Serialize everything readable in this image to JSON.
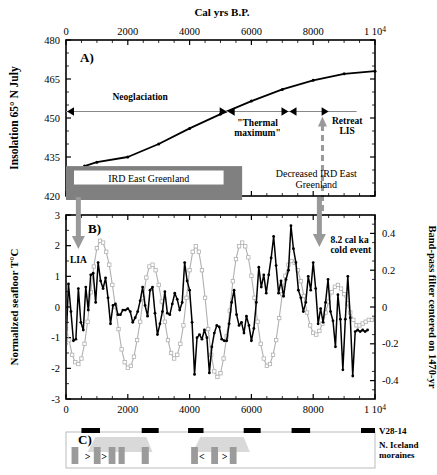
{
  "figure": {
    "top_axis_title": "Cal yrs B.P.",
    "x_ticks": [
      "0",
      "2000",
      "4000",
      "6000",
      "8000",
      "1 10"
    ],
    "x_exponent": "4",
    "x_values": [
      0,
      2000,
      4000,
      6000,
      8000,
      10000
    ],
    "x_range": [
      0,
      10000
    ]
  },
  "panelA": {
    "label": "A)",
    "ylabel": "Insolation 65° N July",
    "y_ticks": [
      "420",
      "435",
      "450",
      "465",
      "480"
    ],
    "y_values": [
      420,
      435,
      450,
      465,
      480
    ],
    "y_range": [
      420,
      480
    ],
    "annotations": {
      "neoglaciation": "Neoglaciation",
      "thermal_max_line1": "\"Thermal",
      "thermal_max_line2": "maximum\"",
      "retreat_line1": "Retreat",
      "retreat_line2": "LIS",
      "ird_bar_label": "IRD East Greenland",
      "decreased_line1": "Decreased IRD East",
      "decreased_line2": "Greenland"
    },
    "arrow_spans": {
      "neoglaciation": [
        0,
        5200
      ],
      "thermal_maximum": [
        5200,
        7200
      ],
      "retreat_lis": [
        7200,
        8500
      ]
    },
    "chart_data": {
      "type": "line",
      "title": "Insolation 65° N July",
      "xlabel": "Cal yrs B.P.",
      "ylabel": "Insolation 65° N July",
      "xlim": [
        0,
        10000
      ],
      "ylim": [
        420,
        480
      ],
      "grid": false,
      "x": [
        600,
        1000,
        2000,
        3000,
        4000,
        5000,
        6000,
        7000,
        8000,
        9000,
        10000
      ],
      "values": [
        431.5,
        433.0,
        435.0,
        440.0,
        446.0,
        451.5,
        456.5,
        461.0,
        464.5,
        467.0,
        468.0
      ]
    }
  },
  "panelB": {
    "label": "B)",
    "ylabel_left": "Normalized seafloor T°C",
    "ylabel_right": "Band-pass filter centered on 1470-yr",
    "y_left_ticks": [
      "-3",
      "-2",
      "-1",
      "0",
      "1",
      "2",
      "3"
    ],
    "y_left_values": [
      -3,
      -2,
      -1,
      0,
      1,
      2,
      3
    ],
    "y_right_ticks": [
      "-0.4",
      "-0.2",
      "0",
      "0.2",
      "0.4"
    ],
    "y_right_values": [
      -0.4,
      -0.2,
      0,
      0.2,
      0.4
    ],
    "annotations": {
      "lia": "LIA",
      "cold_event_line1": "8.2 cal ka",
      "cold_event_line2": "cold event"
    },
    "arrow_positions": {
      "lia": 400,
      "cold_event": 8200
    },
    "chart_data": {
      "type": "line",
      "title": "",
      "xlabel": "Cal yrs B.P.",
      "ylabel": "Normalized seafloor T°C",
      "xlim": [
        0,
        10000
      ],
      "ylim": [
        -3,
        3
      ],
      "y2label": "Band-pass filter centered on 1470-yr",
      "y2lim": [
        -0.5,
        0.5
      ],
      "grid": false,
      "legend": "none",
      "series": [
        {
          "name": "Normalized seafloor temperature",
          "axis": "left",
          "marker": "filled-circle",
          "color": "#000000",
          "x": [
            0,
            80,
            160,
            240,
            320,
            400,
            480,
            560,
            640,
            720,
            800,
            880,
            960,
            1040,
            1120,
            1200,
            1280,
            1360,
            1440,
            1520,
            1600,
            1680,
            1760,
            1840,
            1920,
            2000,
            2080,
            2160,
            2240,
            2320,
            2400,
            2480,
            2560,
            2640,
            2720,
            2800,
            2880,
            2960,
            3040,
            3120,
            3200,
            3280,
            3360,
            3440,
            3520,
            3600,
            3680,
            3760,
            3840,
            3920,
            4000,
            4080,
            4160,
            4240,
            4320,
            4400,
            4480,
            4560,
            4640,
            4720,
            4800,
            4880,
            4960,
            5040,
            5120,
            5200,
            5280,
            5360,
            5440,
            5520,
            5600,
            5680,
            5760,
            5840,
            5920,
            6000,
            6080,
            6160,
            6240,
            6320,
            6400,
            6480,
            6560,
            6640,
            6720,
            6800,
            6880,
            6960,
            7040,
            7120,
            7200,
            7280,
            7360,
            7440,
            7520,
            7600,
            7680,
            7760,
            7840,
            7920,
            8000,
            8080,
            8160,
            8240,
            8320,
            8400,
            8480,
            8560,
            8640,
            8720,
            8800,
            8880,
            8960,
            9040,
            9120,
            9200,
            9280,
            9360,
            9440,
            9520,
            9600,
            9680,
            9760,
            9840,
            9920,
            10000
          ],
          "values": [
            -1.2,
            0.75,
            -0.15,
            -1.1,
            -1.05,
            0.6,
            -0.5,
            -0.75,
            0.65,
            -0.1,
            1.05,
            1.1,
            0.15,
            1.45,
            0.85,
            0.6,
            0.95,
            0.3,
            -0.55,
            0.05,
            0.1,
            -0.25,
            -0.25,
            -0.1,
            -0.1,
            -0.05,
            -0.15,
            -0.5,
            -0.35,
            -0.15,
            0.2,
            0.65,
            0.05,
            -0.3,
            0.55,
            0.65,
            -0.2,
            -0.9,
            -0.55,
            -0.15,
            0.5,
            -0.2,
            -0.25,
            0.1,
            0.45,
            0.25,
            -0.1,
            0.15,
            1.45,
            0.85,
            0.55,
            -0.5,
            -2.2,
            -1.0,
            -0.9,
            -1.05,
            -0.75,
            -1.0,
            -2.15,
            -1.3,
            -0.85,
            -0.6,
            -0.65,
            -1.05,
            -1.1,
            -1.1,
            -0.55,
            0.15,
            0.55,
            -0.25,
            -0.6,
            -0.5,
            -0.85,
            -0.3,
            -0.6,
            -1.1,
            -0.7,
            0.15,
            1.3,
            0.65,
            1.05,
            0.45,
            1.05,
            1.6,
            2.3,
            1.35,
            0.45,
            0.85,
            0.35,
            0.9,
            1.2,
            2.65,
            1.9,
            1.45,
            0.55,
            0.3,
            -0.15,
            0.15,
            1.0,
            0.55,
            1.45,
            0.6,
            -0.55,
            -0.05,
            -0.5,
            0.15,
            0.9,
            -0.15,
            -0.45,
            -1.3,
            0.4,
            -0.4,
            -2.05,
            -0.4,
            1.0,
            -0.35,
            -2.25,
            -0.8,
            -0.75,
            -0.8,
            -0.75,
            -0.8,
            -0.75
          ]
        },
        {
          "name": "Band-pass filter 1470-yr",
          "axis": "right",
          "marker": "open-square",
          "color": "#b0b0b0",
          "x": [
            0,
            100,
            200,
            300,
            400,
            500,
            600,
            700,
            800,
            900,
            1000,
            1100,
            1200,
            1300,
            1400,
            1500,
            1600,
            1700,
            1800,
            1900,
            2000,
            2100,
            2200,
            2300,
            2400,
            2500,
            2600,
            2700,
            2800,
            2900,
            3000,
            3100,
            3200,
            3300,
            3400,
            3500,
            3600,
            3700,
            3800,
            3900,
            4000,
            4100,
            4200,
            4300,
            4400,
            4500,
            4600,
            4700,
            4800,
            4900,
            5000,
            5100,
            5200,
            5300,
            5400,
            5500,
            5600,
            5700,
            5800,
            5900,
            6000,
            6100,
            6200,
            6300,
            6400,
            6500,
            6600,
            6700,
            6800,
            6900,
            7000,
            7100,
            7200,
            7300,
            7400,
            7500,
            7600,
            7700,
            7800,
            7900,
            8000,
            8100,
            8200,
            8300,
            8400,
            8500,
            8600,
            8700,
            8800,
            8900,
            9000,
            9100,
            9200,
            9300,
            9400,
            9500,
            9600,
            9700,
            9800,
            9900,
            10000
          ],
          "values": [
            -0.12,
            -0.18,
            -0.26,
            -0.3,
            -0.31,
            -0.28,
            -0.2,
            -0.08,
            0.08,
            0.22,
            0.32,
            0.36,
            0.35,
            0.3,
            0.23,
            0.12,
            0.0,
            -0.12,
            -0.23,
            -0.3,
            -0.33,
            -0.32,
            -0.27,
            -0.18,
            -0.08,
            0.05,
            0.16,
            0.22,
            0.23,
            0.2,
            0.12,
            0.03,
            -0.08,
            -0.18,
            -0.25,
            -0.28,
            -0.26,
            -0.2,
            -0.1,
            0.05,
            0.2,
            0.3,
            0.33,
            0.3,
            0.2,
            0.05,
            -0.12,
            -0.26,
            -0.35,
            -0.38,
            -0.36,
            -0.28,
            -0.16,
            -0.02,
            0.14,
            0.26,
            0.33,
            0.35,
            0.33,
            0.27,
            0.17,
            0.05,
            -0.08,
            -0.2,
            -0.28,
            -0.32,
            -0.31,
            -0.26,
            -0.18,
            -0.06,
            0.07,
            0.17,
            0.23,
            0.25,
            0.24,
            0.2,
            0.14,
            0.06,
            -0.03,
            -0.1,
            -0.14,
            -0.15,
            -0.13,
            -0.09,
            -0.03,
            0.03,
            0.08,
            0.11,
            0.12,
            0.1,
            0.07,
            0.02,
            -0.03,
            -0.07,
            -0.1,
            -0.1,
            -0.09,
            -0.08,
            -0.07,
            -0.07,
            -0.07
          ]
        }
      ]
    }
  },
  "panelC": {
    "label": "C)",
    "legend_v28": "V28-14",
    "legend_moraines_line1": "N. Iceland",
    "legend_moraines_line2": "moraines",
    "v28_bars": [
      {
        "start": 500,
        "end": 1100
      },
      {
        "start": 2450,
        "end": 3000
      },
      {
        "start": 3950,
        "end": 4450
      },
      {
        "start": 5750,
        "end": 6300
      },
      {
        "start": 7300,
        "end": 7900
      },
      {
        "start": 9600,
        "end": 10000
      }
    ],
    "trapezoids": [
      {
        "base_start": 700,
        "base_end": 2800,
        "top_start": 950,
        "top_end": 2600
      },
      {
        "base_start": 4100,
        "base_end": 5950,
        "top_start": 4350,
        "top_end": 5750
      }
    ],
    "moraine_bars": [
      {
        "start": 180,
        "end": 400
      },
      {
        "start": 900,
        "end": 1120
      },
      {
        "start": 1380,
        "end": 1600
      },
      {
        "start": 1700,
        "end": 1900
      },
      {
        "start": 2450,
        "end": 2680
      },
      {
        "start": 4050,
        "end": 4270
      },
      {
        "start": 4700,
        "end": 4920
      },
      {
        "start": 5300,
        "end": 5520
      }
    ],
    "moraine_markers": [
      {
        "pos": 700,
        "glyph": ">"
      },
      {
        "pos": 1230,
        "glyph": ">"
      },
      {
        "pos": 4400,
        "glyph": "<"
      },
      {
        "pos": 5130,
        "glyph": ">"
      }
    ]
  },
  "colors": {
    "gray_bar": "#808080",
    "light_gray": "#d9d9d9",
    "arrow_gray": "#999999",
    "black": "#000000"
  }
}
